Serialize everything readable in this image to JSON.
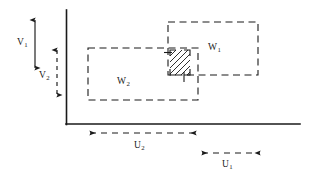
{
  "figure": {
    "kind": "technical-line-diagram",
    "background_color": "#ffffff",
    "stroke_color": "#1a1a1a",
    "labels": {
      "v1": {
        "base": "V",
        "sub": "1"
      },
      "v2": {
        "base": "V",
        "sub": "2"
      },
      "w1": {
        "base": "W",
        "sub": "1"
      },
      "w2": {
        "base": "W",
        "sub": "2"
      },
      "u1": {
        "base": "U",
        "sub": "1"
      },
      "u2": {
        "base": "U",
        "sub": "2"
      }
    },
    "axes": {
      "name": "corner-axes",
      "style": "solid",
      "vertical": {
        "x": 66,
        "y_top": 10,
        "y_bottom": 124
      },
      "horizontal": {
        "y": 124,
        "x_left": 66,
        "x_right": 300
      }
    },
    "regions": [
      {
        "id": "w1",
        "label": "W1",
        "style": "dashed",
        "x": 168,
        "y": 22,
        "width": 90,
        "height": 53
      },
      {
        "id": "w2",
        "label": "W2",
        "style": "dashed",
        "x": 88,
        "y": 48,
        "width": 110,
        "height": 52
      },
      {
        "id": "overlap",
        "label": "hatched-intersection",
        "style": "solid-hatched",
        "x": 170,
        "y": 50,
        "width": 20,
        "height": 25
      }
    ],
    "dimension_arrows": [
      {
        "id": "v1",
        "label": "V1",
        "orientation": "vertical",
        "style": "solid",
        "heads": "both",
        "x": 35,
        "y_start": 18,
        "y_end": 70
      },
      {
        "id": "v2",
        "label": "V2",
        "orientation": "vertical",
        "style": "dashed",
        "heads": "both",
        "x": 57,
        "y_start": 48,
        "y_end": 97
      },
      {
        "id": "u2",
        "label": "U2",
        "orientation": "horizontal",
        "style": "dashed",
        "heads": "both",
        "y": 133,
        "x_start": 88,
        "x_end": 198
      },
      {
        "id": "u1",
        "label": "U1",
        "orientation": "horizontal",
        "style": "dashed",
        "heads": "both",
        "y": 153,
        "x_start": 200,
        "x_end": 262
      }
    ]
  }
}
